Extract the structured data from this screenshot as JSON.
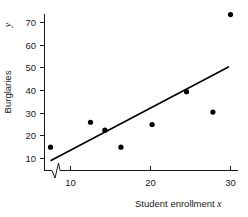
{
  "chart_data": {
    "type": "scatter",
    "title": "",
    "xlabel": "Student enrollment",
    "xvar": "x",
    "ylabel": "Burglaries",
    "yvar": "y",
    "xlim": [
      6.0,
      31.5
    ],
    "ylim": [
      4.0,
      76.0
    ],
    "xticks": [
      10,
      20,
      30
    ],
    "xtick_labels": [
      "10",
      "20",
      "30"
    ],
    "yticks": [
      10,
      20,
      30,
      40,
      50,
      60,
      70
    ],
    "ytick_labels": [
      "10",
      "20",
      "30",
      "40",
      "50",
      "60",
      "70"
    ],
    "grid": false,
    "legend": "none",
    "axis_break": {
      "axis": "x",
      "symbol": "zigzag",
      "position": 8.2
    },
    "points": [
      {
        "x": 7.5,
        "y": 15.0
      },
      {
        "x": 12.5,
        "y": 26.0
      },
      {
        "x": 14.3,
        "y": 22.5
      },
      {
        "x": 16.3,
        "y": 15.0
      },
      {
        "x": 20.2,
        "y": 25.0
      },
      {
        "x": 24.5,
        "y": 39.5
      },
      {
        "x": 27.8,
        "y": 30.5
      },
      {
        "x": 30.0,
        "y": 73.5
      }
    ],
    "series": [
      {
        "name": "Observations",
        "type": "scatter",
        "x": [
          7.5,
          12.5,
          14.3,
          16.3,
          20.2,
          24.5,
          27.8,
          30.0
        ],
        "values": [
          15.0,
          26.0,
          22.5,
          15.0,
          25.0,
          39.5,
          30.5,
          73.5
        ]
      },
      {
        "name": "Fitted regression line",
        "type": "line",
        "x": [
          7.5,
          29.8
        ],
        "values": [
          9.0,
          50.5
        ]
      }
    ],
    "fit_line": {
      "x_start": 7.5,
      "y_start": 9.0,
      "x_end": 29.8,
      "y_end": 50.5,
      "slope": 1.86,
      "intercept": -4.95
    },
    "colors": {
      "point": "#000000",
      "line": "#000000",
      "axis": "#1a1a1a",
      "background": "#ffffff"
    }
  }
}
